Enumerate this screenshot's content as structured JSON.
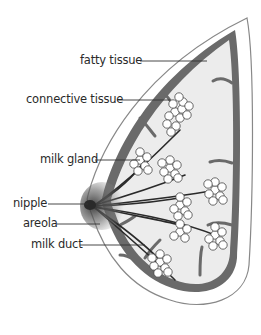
{
  "diagram": {
    "colors": {
      "outline": "#888888",
      "connective": "#6a6a6a",
      "fat_fill": "#ececec",
      "skin_fill": "#ffffff",
      "duct": "#2a2a2a",
      "gland_fill": "#ffffff",
      "areola_shade": "#555555",
      "text": "#2a2a2a"
    },
    "labels": [
      {
        "id": "fatty-tissue",
        "text": "fatty tissue"
      },
      {
        "id": "connective-tissue",
        "text": "connective tissue"
      },
      {
        "id": "milk-gland",
        "text": "milk gland"
      },
      {
        "id": "nipple",
        "text": "nipple"
      },
      {
        "id": "areola",
        "text": "areola"
      },
      {
        "id": "milk-duct",
        "text": "milk duct"
      }
    ]
  }
}
